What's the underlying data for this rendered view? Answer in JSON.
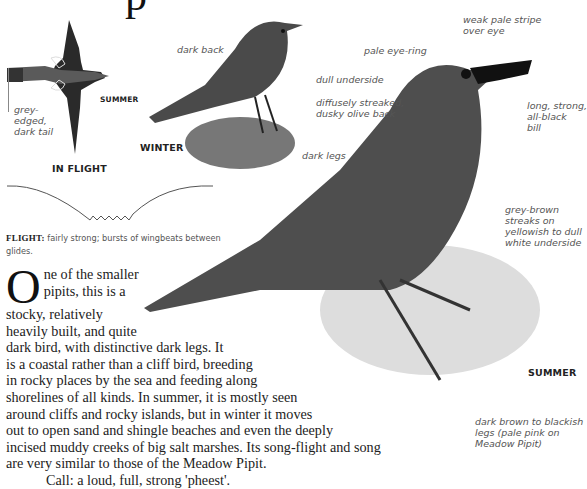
{
  "title_fragment": "p",
  "flight_section": {
    "season_label": "SUMMER",
    "caption": "IN FLIGHT",
    "tail_label": "grey-\nedged,\ndark tail",
    "flight_caption_bold": "FLIGHT:",
    "flight_caption_text": "fairly strong; bursts of wingbeats between glides."
  },
  "winter_section": {
    "caption": "WINTER",
    "labels": {
      "dark_back": "dark back",
      "dull_underside": "dull underside",
      "dark_legs": "dark legs"
    }
  },
  "summer_section": {
    "caption": "SUMMER",
    "labels": {
      "weak_stripe": "weak pale stripe\nover eye",
      "eye_ring": "pale eye-ring",
      "back": "diffusely streaked,\ndusky olive back",
      "bill": "long, strong,\nall-black\nbill",
      "streaks": "grey-brown\nstreaks on\nyellowish to dull\nwhite underside",
      "legs": "dark brown to blackish\nlegs (pale pink on\nMeadow Pipit)"
    }
  },
  "body": {
    "drop_cap": "O",
    "lines": [
      "ne of the smaller",
      "pipits, this is a",
      "stocky, relatively",
      "heavily built, and quite",
      "dark bird, with distinctive dark legs. It",
      "is a coastal rather than a cliff bird, breeding",
      "in rocky places by the sea and feeding along",
      "shorelines of all kinds. In summer, it is mostly seen",
      "around cliffs and rocky islands, but in winter it moves",
      "out to open sand and shingle beaches and even the deeply",
      "incised muddy creeks of big salt marshes. Its song-flight and song",
      "are very similar to those of the Meadow Pipit.",
      "Call: a loud, full, strong 'pheest'."
    ]
  },
  "colors": {
    "label_grey": "#555555",
    "text_dark": "#222222",
    "leader_grey": "#888888"
  }
}
